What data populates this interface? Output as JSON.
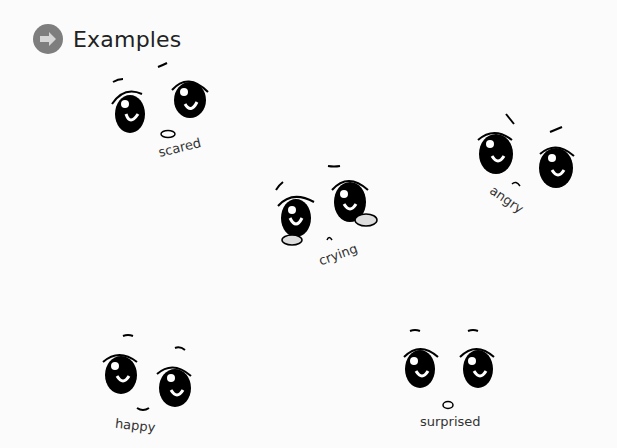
{
  "header": {
    "title": "Examples",
    "icon": "arrow-right-circle-icon",
    "icon_color": "#7e7e7e"
  },
  "faces": [
    {
      "label": "scared"
    },
    {
      "label": "crying"
    },
    {
      "label": "angry"
    },
    {
      "label": "happy"
    },
    {
      "label": "surprised"
    }
  ]
}
